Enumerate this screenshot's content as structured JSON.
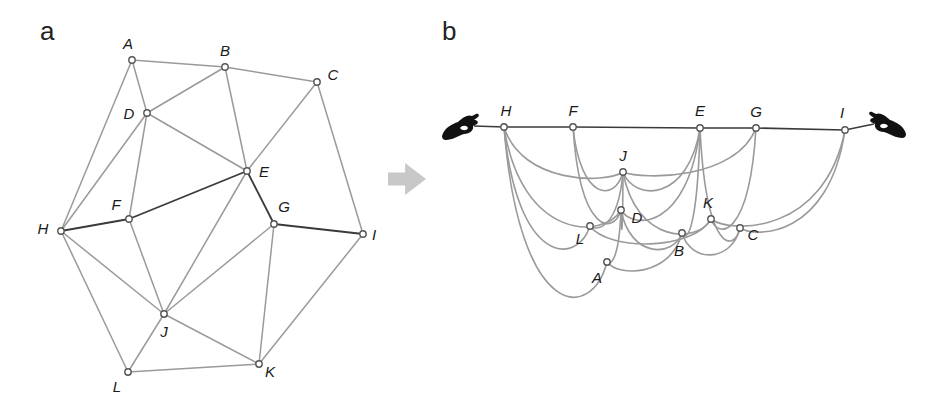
{
  "figure": {
    "panels": [
      {
        "id": "a",
        "label": "a",
        "label_pos": [
          40,
          40
        ],
        "description": "Planar graph with 12 nodes; shortest path H-F-E-G-I highlighted in dark",
        "nodes": [
          {
            "id": "A",
            "x": 132,
            "y": 60,
            "label_dx": -4,
            "label_dy": -17
          },
          {
            "id": "B",
            "x": 225,
            "y": 67,
            "label_dx": 0,
            "label_dy": -17
          },
          {
            "id": "C",
            "x": 317,
            "y": 82,
            "label_dx": 16,
            "label_dy": -8
          },
          {
            "id": "D",
            "x": 147,
            "y": 113,
            "label_dx": -18,
            "label_dy": 0
          },
          {
            "id": "E",
            "x": 247,
            "y": 171,
            "label_dx": 17,
            "label_dy": 0
          },
          {
            "id": "F",
            "x": 129,
            "y": 219,
            "label_dx": -13,
            "label_dy": -15
          },
          {
            "id": "G",
            "x": 274,
            "y": 224,
            "label_dx": 10,
            "label_dy": -18
          },
          {
            "id": "H",
            "x": 61,
            "y": 231,
            "label_dx": -18,
            "label_dy": -3
          },
          {
            "id": "I",
            "x": 363,
            "y": 234,
            "label_dx": 11,
            "label_dy": 0
          },
          {
            "id": "J",
            "x": 164,
            "y": 314,
            "label_dx": 0,
            "label_dy": 17
          },
          {
            "id": "K",
            "x": 259,
            "y": 364,
            "label_dx": 11,
            "label_dy": 7
          },
          {
            "id": "L",
            "x": 128,
            "y": 372,
            "label_dx": -11,
            "label_dy": 14
          }
        ],
        "edges": [
          {
            "from": "A",
            "to": "B",
            "highlight": false
          },
          {
            "from": "B",
            "to": "C",
            "highlight": false
          },
          {
            "from": "A",
            "to": "D",
            "highlight": false
          },
          {
            "from": "A",
            "to": "H",
            "highlight": false
          },
          {
            "from": "B",
            "to": "D",
            "highlight": false
          },
          {
            "from": "B",
            "to": "E",
            "highlight": false
          },
          {
            "from": "C",
            "to": "E",
            "highlight": false
          },
          {
            "from": "C",
            "to": "I",
            "highlight": false
          },
          {
            "from": "D",
            "to": "E",
            "highlight": false
          },
          {
            "from": "D",
            "to": "H",
            "highlight": false
          },
          {
            "from": "D",
            "to": "F",
            "highlight": false
          },
          {
            "from": "H",
            "to": "F",
            "highlight": true
          },
          {
            "from": "F",
            "to": "E",
            "highlight": true
          },
          {
            "from": "E",
            "to": "G",
            "highlight": true
          },
          {
            "from": "G",
            "to": "I",
            "highlight": true
          },
          {
            "from": "E",
            "to": "J",
            "highlight": false
          },
          {
            "from": "F",
            "to": "J",
            "highlight": false
          },
          {
            "from": "H",
            "to": "J",
            "highlight": false
          },
          {
            "from": "H",
            "to": "L",
            "highlight": false
          },
          {
            "from": "G",
            "to": "J",
            "highlight": false
          },
          {
            "from": "G",
            "to": "K",
            "highlight": false
          },
          {
            "from": "I",
            "to": "K",
            "highlight": false
          },
          {
            "from": "J",
            "to": "K",
            "highlight": false
          },
          {
            "from": "J",
            "to": "L",
            "highlight": false
          },
          {
            "from": "L",
            "to": "K",
            "highlight": false
          }
        ]
      },
      {
        "id": "b",
        "label": "b",
        "label_pos": [
          442,
          40
        ],
        "description": "String model of the graph pulled taut between nodes H and I; taut strings form the shortest path, others hang slack",
        "nodes": [
          {
            "id": "H",
            "x": 504,
            "y": 127,
            "label_dx": 2,
            "label_dy": -17
          },
          {
            "id": "F",
            "x": 573,
            "y": 127,
            "label_dx": 0,
            "label_dy": -17
          },
          {
            "id": "E",
            "x": 700,
            "y": 128,
            "label_dx": 0,
            "label_dy": -18
          },
          {
            "id": "G",
            "x": 756,
            "y": 128,
            "label_dx": 0,
            "label_dy": -17
          },
          {
            "id": "I",
            "x": 845,
            "y": 130,
            "label_dx": -3,
            "label_dy": -18
          },
          {
            "id": "J",
            "x": 623,
            "y": 172,
            "label_dx": 0,
            "label_dy": -17
          },
          {
            "id": "D",
            "x": 621,
            "y": 210,
            "label_dx": 16,
            "label_dy": 7
          },
          {
            "id": "L",
            "x": 590,
            "y": 226,
            "label_dx": -10,
            "label_dy": 12
          },
          {
            "id": "K",
            "x": 711,
            "y": 219,
            "label_dx": -3,
            "label_dy": -17
          },
          {
            "id": "C",
            "x": 740,
            "y": 228,
            "label_dx": 13,
            "label_dy": 6
          },
          {
            "id": "B",
            "x": 682,
            "y": 233,
            "label_dx": -3,
            "label_dy": 17
          },
          {
            "id": "A",
            "x": 607,
            "y": 262,
            "label_dx": -10,
            "label_dy": 15
          }
        ],
        "taut_path": [
          "H",
          "F",
          "E",
          "G",
          "I"
        ],
        "slack_edges": [
          {
            "from": "H",
            "to": "A",
            "sag": 60
          },
          {
            "from": "H",
            "to": "L",
            "sag": 40
          },
          {
            "from": "H",
            "to": "D",
            "sag": 30
          },
          {
            "from": "H",
            "to": "J",
            "sag": 12
          },
          {
            "from": "F",
            "to": "J",
            "sag": 30
          },
          {
            "from": "F",
            "to": "D",
            "sag": 25
          },
          {
            "from": "E",
            "to": "J",
            "sag": 30
          },
          {
            "from": "E",
            "to": "D",
            "sag": 20
          },
          {
            "from": "E",
            "to": "B",
            "sag": 8
          },
          {
            "from": "E",
            "to": "C",
            "sag": 25
          },
          {
            "from": "G",
            "to": "J",
            "sag": 8
          },
          {
            "from": "G",
            "to": "K",
            "sag": 20
          },
          {
            "from": "I",
            "to": "K",
            "sag": 15
          },
          {
            "from": "I",
            "to": "C",
            "sag": 10
          },
          {
            "from": "J",
            "to": "K",
            "sag": 25
          },
          {
            "from": "J",
            "to": "L",
            "sag": 5
          },
          {
            "from": "J",
            "to": "D",
            "sag": 30
          },
          {
            "from": "D",
            "to": "B",
            "sag": 25
          },
          {
            "from": "A",
            "to": "D",
            "sag": 3
          },
          {
            "from": "A",
            "to": "B",
            "sag": 15
          },
          {
            "from": "L",
            "to": "K",
            "sag": 25
          },
          {
            "from": "B",
            "to": "C",
            "sag": 30
          }
        ],
        "hands": [
          {
            "id": "left-hand",
            "x": 442,
            "y": 112,
            "anchor_to": "H",
            "flip": false
          },
          {
            "id": "right-hand",
            "x": 870,
            "y": 110,
            "anchor_to": "I",
            "flip": true
          }
        ]
      }
    ],
    "arrow": {
      "x": 388,
      "y": 163,
      "width": 38,
      "height": 32,
      "color": "#c8c8c8"
    },
    "colors": {
      "edge": "#9a9a9a",
      "highlight_edge": "#3a3a3a",
      "node_fill": "#ffffff",
      "node_stroke": "#555555",
      "label": "#1a1a1a",
      "hand": "#111111"
    }
  }
}
